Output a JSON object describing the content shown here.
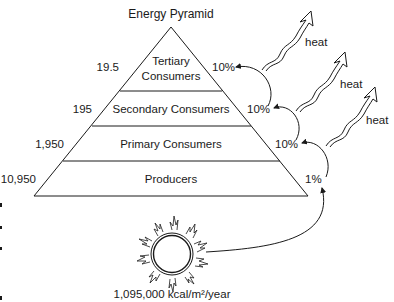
{
  "title": "Energy Pyramid",
  "levels": [
    {
      "name_lines": [
        "Tertiary",
        "Consumers"
      ],
      "energy": "19.5",
      "efficiency": "10%"
    },
    {
      "name_lines": [
        "Secondary Consumers"
      ],
      "energy": "195",
      "efficiency": "10%"
    },
    {
      "name_lines": [
        "Primary Consumers"
      ],
      "energy": "1,950",
      "efficiency": "10%"
    },
    {
      "name_lines": [
        "Producers"
      ],
      "energy": "10,950",
      "efficiency": "1%"
    }
  ],
  "heat_labels": [
    "heat",
    "heat",
    "heat"
  ],
  "sun": {
    "label": "1,095,000 kcal/m²/year",
    "icon": "sun-icon"
  },
  "colors": {
    "line": "#1a1a1a",
    "background": "#ffffff"
  }
}
